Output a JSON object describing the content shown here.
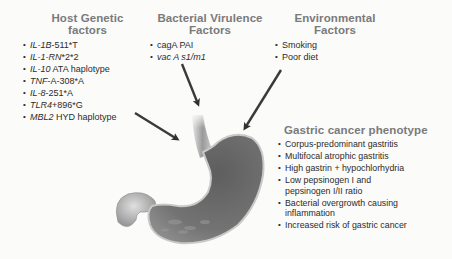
{
  "host": {
    "title_line1": "Host Genetic",
    "title_line2": "factors",
    "items": [
      {
        "gene": "IL-1B",
        "rest": "-511*T"
      },
      {
        "gene": "IL-1-RN",
        "rest": "*2*2"
      },
      {
        "gene": "IL-10",
        "rest": " ATA haplotype"
      },
      {
        "gene": "TNF",
        "rest": "-A-308*A"
      },
      {
        "gene": "IL-8",
        "rest": "-251*A"
      },
      {
        "gene": "TLR4",
        "rest": "+896*G"
      },
      {
        "gene": "MBL2",
        "rest": " HYD haplotype"
      }
    ]
  },
  "bacterial": {
    "title_line1": "Bacterial Virulence",
    "title_line2": "Factors",
    "items": [
      {
        "text": "cagA PAI",
        "italic": false
      },
      {
        "text": "vac A s1/m1",
        "italic": true
      }
    ]
  },
  "environmental": {
    "title_line1": "Environmental",
    "title_line2": "Factors",
    "items": [
      "Smoking",
      "Poor diet"
    ]
  },
  "phenotype": {
    "title": "Gastric cancer phenotype",
    "items": [
      [
        "Corpus-predominant gastritis"
      ],
      [
        "Multifocal atrophic gastritis"
      ],
      [
        "High gastrin + hypochlorhydria"
      ],
      [
        "Low pepsinogen I and",
        "pepsinogen I/II ratio"
      ],
      [
        "Bacterial overgrowth causing",
        "inflammation"
      ],
      [
        "Increased risk of gastric cancer"
      ]
    ]
  },
  "illustration": {
    "label": "stomach",
    "colors": {
      "header": "#7a7a7a",
      "stomach": "#6e6e6e",
      "arrow": "#333333"
    }
  }
}
